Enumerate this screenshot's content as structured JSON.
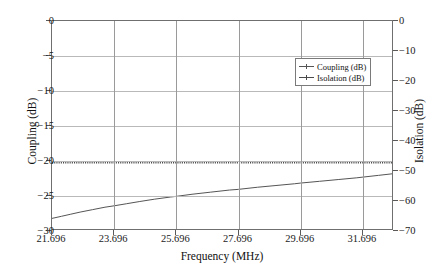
{
  "chart_data": {
    "type": "line",
    "title": "",
    "xlabel": "Frequency (MHz)",
    "ylabel": "Coupling (dB)",
    "ylabel_secondary": "Isolation (dB)",
    "xlim": [
      21.696,
      32.696
    ],
    "ylim": [
      -30,
      0
    ],
    "ylim_secondary": [
      -70,
      0
    ],
    "grid": true,
    "legend_position": "upper right",
    "xticks": [
      "21.696",
      "23.696",
      "25.696",
      "27.696",
      "29.696",
      "31.696"
    ],
    "xtick_values": [
      21.696,
      23.696,
      25.696,
      27.696,
      29.696,
      31.696
    ],
    "yticks": [
      "0",
      "−5",
      "−10",
      "−15",
      "−20",
      "−25",
      "−30"
    ],
    "ytick_values": [
      0,
      -5,
      -10,
      -15,
      -20,
      -25,
      -30
    ],
    "yticks_secondary": [
      "0",
      "−10",
      "−20",
      "−30",
      "−40",
      "−50",
      "−60",
      "−70"
    ],
    "ytick_values_secondary": [
      0,
      -10,
      -20,
      -30,
      -40,
      -50,
      -60,
      -70
    ],
    "series": [
      {
        "name": "Coupling (dB)",
        "axis": "left",
        "color": "#555555",
        "style": "solid",
        "x": [
          21.696,
          22.0,
          22.3,
          22.6,
          23.0,
          23.4,
          23.696,
          24.1,
          24.5,
          25.0,
          25.5,
          25.696,
          26.2,
          26.8,
          27.4,
          27.696,
          28.3,
          28.9,
          29.5,
          29.696,
          30.3,
          30.9,
          31.5,
          31.696,
          32.2,
          32.696
        ],
        "values": [
          -28.2,
          -27.9,
          -27.6,
          -27.3,
          -26.95,
          -26.6,
          -26.4,
          -26.1,
          -25.8,
          -25.45,
          -25.15,
          -25.05,
          -24.75,
          -24.45,
          -24.15,
          -24.05,
          -23.75,
          -23.5,
          -23.25,
          -23.15,
          -22.9,
          -22.65,
          -22.4,
          -22.3,
          -22.05,
          -21.8
        ]
      },
      {
        "name": "Isolation (dB)",
        "axis": "right",
        "color": "#4a4a4a",
        "style": "dotted",
        "x": [
          21.696,
          32.696
        ],
        "values": [
          -47.1,
          -47.1
        ]
      }
    ],
    "legend": [
      "Coupling (dB)",
      "Isolation (dB)"
    ]
  },
  "axes": {
    "left_title": "Coupling (dB)",
    "right_title": "Isolation (dB)",
    "bottom_title": "Frequency (MHz)"
  },
  "legend": {
    "entries": [
      {
        "label": "Coupling (dB)"
      },
      {
        "label": "Isolation (dB)"
      }
    ]
  }
}
